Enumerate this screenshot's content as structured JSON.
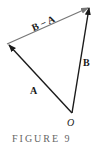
{
  "figure": {
    "caption": "FIGURE 9",
    "origin_label": "O",
    "vectors": [
      {
        "name": "A",
        "label": "A",
        "from": [
          72,
          113
        ],
        "to": [
          8,
          44
        ],
        "color": "#1a1a1a"
      },
      {
        "name": "B",
        "label": "B",
        "from": [
          72,
          113
        ],
        "to": [
          89,
          7
        ],
        "color": "#1a1a1a"
      },
      {
        "name": "B-A",
        "label": "B − A",
        "from": [
          8,
          44
        ],
        "to": [
          89,
          7
        ],
        "color": "#777777"
      }
    ]
  }
}
